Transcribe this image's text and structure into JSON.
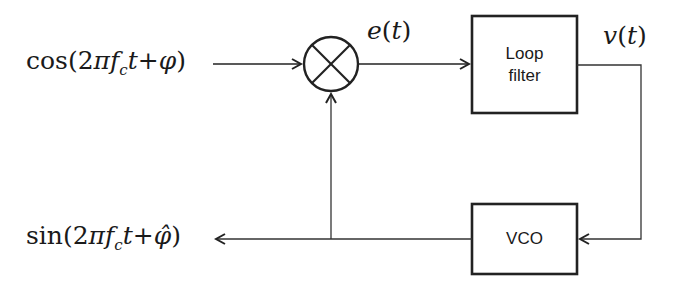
{
  "diagram": {
    "nodes": [
      {
        "id": "input",
        "label": "cos(2πf_c t+φ)",
        "kind": "signal"
      },
      {
        "id": "multiplier",
        "label": "⊗",
        "kind": "multiplier"
      },
      {
        "id": "loop_filter",
        "label": "Loop filter",
        "kind": "block"
      },
      {
        "id": "vco",
        "label": "VCO",
        "kind": "block"
      },
      {
        "id": "output",
        "label": "sin(2πf_c t+φ̂)",
        "kind": "signal"
      }
    ],
    "edges": [
      {
        "from": "input",
        "to": "multiplier",
        "label": ""
      },
      {
        "from": "multiplier",
        "to": "loop_filter",
        "label": "e(t)"
      },
      {
        "from": "loop_filter",
        "to": "vco",
        "label": "v(t)"
      },
      {
        "from": "vco",
        "to": "output",
        "label": ""
      },
      {
        "from": "vco",
        "to": "multiplier",
        "label": ""
      }
    ]
  },
  "labels": {
    "input": {
      "fn": "cos",
      "open": "(2",
      "pi": "π",
      "f": "f",
      "sub": "c",
      "t": "t",
      "plus": "+",
      "phi": "φ",
      "close": ")"
    },
    "output": {
      "fn": "sin",
      "open": "(2",
      "pi": "π",
      "f": "f",
      "sub": "c",
      "t": "t",
      "plus": "+",
      "phi": "φ̂",
      "close": ")"
    },
    "error_signal": {
      "name": "e",
      "open": "(",
      "t": "t",
      "close": ")"
    },
    "control_signal": {
      "name": "v",
      "open": "(",
      "t": "t",
      "close": ")"
    },
    "loop_filter_line1": "Loop",
    "loop_filter_line2": "filter",
    "vco": "VCO"
  },
  "colors": {
    "stroke": "#222222",
    "background": "#ffffff"
  }
}
